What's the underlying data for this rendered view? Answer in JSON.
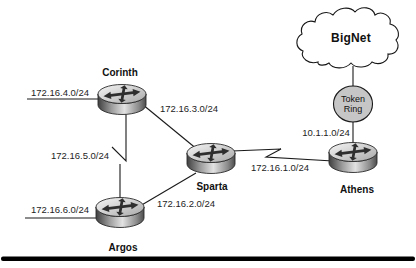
{
  "nodes": {
    "corinth": {
      "label": "Corinth",
      "type": "router"
    },
    "sparta": {
      "label": "Sparta",
      "type": "router"
    },
    "argos": {
      "label": "Argos",
      "type": "router"
    },
    "athens": {
      "label": "Athens",
      "type": "router"
    },
    "bignet": {
      "label": "BigNet",
      "type": "cloud"
    },
    "token_ring": {
      "label_line1": "Token",
      "label_line2": "Ring",
      "type": "token-ring"
    }
  },
  "networks": {
    "corinth_lan": "172.16.4.0/24",
    "corinth_sparta": "172.16.3.0/24",
    "corinth_argos": "172.16.5.0/24",
    "argos_lan": "172.16.6.0/24",
    "argos_sparta": "172.16.2.0/24",
    "sparta_athens": "172.16.1.0/24",
    "athens_tokenring": "10.1.1.0/24"
  },
  "icons": {
    "router": "cisco-router-icon",
    "cloud": "network-cloud-icon",
    "token_ring": "token-ring-icon"
  },
  "colors": {
    "background": "#ffffff",
    "line": "#1a1a1a",
    "cloud_fill": "#ffffff",
    "token_ring_fill": "#c6c6c6",
    "router_arrows": "#2e2e2e",
    "bottom_divider": "#000000"
  }
}
